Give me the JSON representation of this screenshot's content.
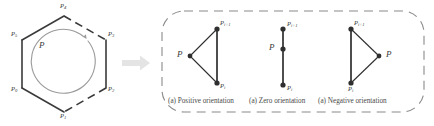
{
  "figure": {
    "background_color": "#ffffff",
    "ink_color": "#3a3a3a",
    "panel_border_color": "#8a8a8a",
    "arrow_color": "#e2e2e2"
  },
  "polygon": {
    "name": "hexagon",
    "interior_label": "P",
    "orientation_arrow": "counterclockwise-arc-arrow",
    "vertices": [
      {
        "id": "v-top",
        "label": "P",
        "sub": "4"
      },
      {
        "id": "v-upper-right",
        "label": "P",
        "sub": "3"
      },
      {
        "id": "v-lower-right",
        "label": "P",
        "sub": "2"
      },
      {
        "id": "v-bottom",
        "label": "P",
        "sub": "1"
      },
      {
        "id": "v-lower-left",
        "label": "P",
        "sub": "0"
      },
      {
        "id": "v-upper-left",
        "label": "P",
        "sub": "5"
      }
    ],
    "edges": [
      {
        "id": "edge-upper-left",
        "style": "solid"
      },
      {
        "id": "edge-upper-right",
        "style": "dashed"
      },
      {
        "id": "edge-right",
        "style": "solid"
      },
      {
        "id": "edge-lower-right",
        "style": "dashed"
      },
      {
        "id": "edge-lower-left",
        "style": "solid"
      },
      {
        "id": "edge-left",
        "style": "solid"
      }
    ]
  },
  "panel": {
    "border_style": "dashed-rounded",
    "cases": [
      {
        "id": "positive",
        "caption": "(a) Positive orientation",
        "points": [
          {
            "id": "p-next",
            "label": "P",
            "sub": "i+1",
            "position": "top-right"
          },
          {
            "id": "p-query",
            "label": "P",
            "sub": "",
            "position": "left"
          },
          {
            "id": "p-cur",
            "label": "P",
            "sub": "i",
            "position": "bottom-right"
          }
        ]
      },
      {
        "id": "zero",
        "caption": "(a) Zero orientation",
        "points": [
          {
            "id": "p-next",
            "label": "P",
            "sub": "i+1",
            "position": "top"
          },
          {
            "id": "p-query",
            "label": "P",
            "sub": "",
            "position": "middle"
          },
          {
            "id": "p-cur",
            "label": "P",
            "sub": "i",
            "position": "bottom"
          }
        ]
      },
      {
        "id": "negative",
        "caption": "(a) Negative orientation",
        "points": [
          {
            "id": "p-next",
            "label": "P",
            "sub": "i+1",
            "position": "top-left"
          },
          {
            "id": "p-query",
            "label": "P",
            "sub": "",
            "position": "right"
          },
          {
            "id": "p-cur",
            "label": "P",
            "sub": "i",
            "position": "bottom-left"
          }
        ]
      }
    ]
  }
}
